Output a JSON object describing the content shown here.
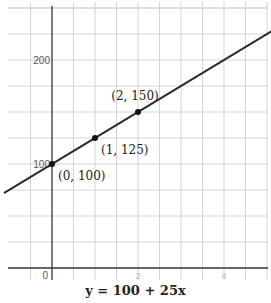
{
  "chart_data": {
    "type": "line",
    "title": "",
    "caption": "y = 100 + 25x",
    "xlabel": "",
    "ylabel": "",
    "equation": {
      "intercept": 100,
      "slope": 25
    },
    "xlim": [
      -1.1,
      5.1
    ],
    "ylim": [
      -10,
      235
    ],
    "grid": true,
    "x_grid_step": 0.5,
    "y_grid_step": 25,
    "x_ticks": [
      {
        "value": 0,
        "label": "0"
      },
      {
        "value": 2,
        "label": "2"
      },
      {
        "value": 4,
        "label": "4"
      }
    ],
    "y_ticks": [
      {
        "value": 100,
        "label": "100"
      },
      {
        "value": 200,
        "label": "200"
      }
    ],
    "series": [
      {
        "name": "y = 100 + 25x",
        "x": [
          -1.1,
          5.1
        ],
        "y": [
          72.5,
          227.5
        ],
        "color": "#2b2b2b"
      }
    ],
    "points": [
      {
        "x": 0,
        "y": 100,
        "label": "(0, 100)"
      },
      {
        "x": 1,
        "y": 125,
        "label": "(1, 125)"
      },
      {
        "x": 2,
        "y": 150,
        "label": "(2, 150)"
      }
    ]
  }
}
